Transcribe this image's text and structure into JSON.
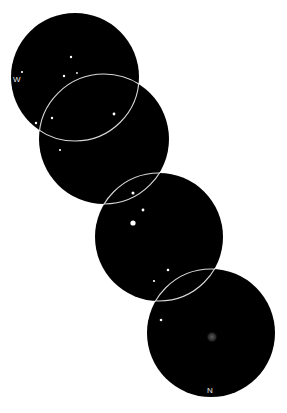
{
  "sketch": {
    "type": "eyepiece field sketch sequence",
    "labels": {
      "west": "W",
      "north": "N"
    },
    "colors": {
      "field": "#000000",
      "background": "#ffffff",
      "ring": "#d8d8d8",
      "star": "#ffffff",
      "nebula": "#555555"
    },
    "fields": [
      {
        "cx": 75,
        "cy": 77,
        "r": 64
      },
      {
        "cx": 104,
        "cy": 139,
        "r": 65
      },
      {
        "cx": 159,
        "cy": 237,
        "r": 64
      },
      {
        "cx": 211,
        "cy": 333,
        "r": 64
      }
    ],
    "stars": [
      {
        "x": 71,
        "y": 57,
        "r": 1.2
      },
      {
        "x": 64,
        "y": 76,
        "r": 1.2
      },
      {
        "x": 77,
        "y": 73,
        "r": 0.9
      },
      {
        "x": 22,
        "y": 72,
        "r": 1.1
      },
      {
        "x": 36,
        "y": 123,
        "r": 1.2
      },
      {
        "x": 52,
        "y": 118,
        "r": 1.2
      },
      {
        "x": 114,
        "y": 114,
        "r": 1.4
      },
      {
        "x": 60,
        "y": 150,
        "r": 1.1
      },
      {
        "x": 133,
        "y": 193,
        "r": 1.5
      },
      {
        "x": 143,
        "y": 210,
        "r": 1.4
      },
      {
        "x": 133,
        "y": 223,
        "r": 2.6
      },
      {
        "x": 168,
        "y": 270,
        "r": 1.3
      },
      {
        "x": 154,
        "y": 281,
        "r": 1.1
      },
      {
        "x": 161,
        "y": 320,
        "r": 1.3
      }
    ],
    "nebula": {
      "x": 212,
      "y": 337,
      "r": 6
    },
    "label_positions": {
      "west": {
        "x": 13,
        "y": 82
      },
      "north": {
        "x": 207,
        "y": 393
      }
    }
  }
}
